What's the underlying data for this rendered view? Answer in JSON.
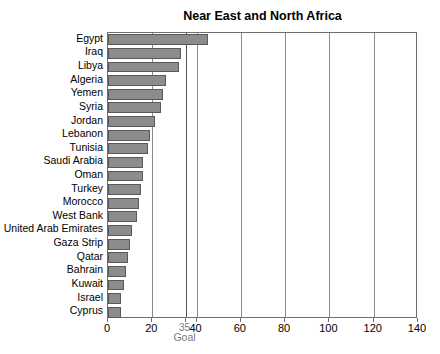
{
  "chart_data": {
    "type": "bar",
    "orientation": "horizontal",
    "title": "Near East and North Africa",
    "xlabel": "Goal",
    "ylabel": "",
    "xlim": [
      0,
      140
    ],
    "ylim": null,
    "grid": true,
    "legend": null,
    "xticks": [
      0,
      20,
      35,
      40,
      60,
      80,
      100,
      120,
      140
    ],
    "xtick_labels": [
      "0",
      "20",
      "35",
      "40",
      "60",
      "80",
      "100",
      "120",
      "140"
    ],
    "goal_value": 35,
    "goal_label": "Goal",
    "bar_color": "#8c8c8c",
    "bar_edge_color": "#595959",
    "categories": [
      "Egypt",
      "Iraq",
      "Libya",
      "Algeria",
      "Yemen",
      "Syria",
      "Jordan",
      "Lebanon",
      "Tunisia",
      "Saudi Arabia",
      "Oman",
      "Turkey",
      "Morocco",
      "West Bank",
      "United Arab Emirates",
      "Gaza Strip",
      "Qatar",
      "Bahrain",
      "Kuwait",
      "Israel",
      "Cyprus"
    ],
    "values": [
      45,
      33,
      32,
      26,
      25,
      24,
      21,
      19,
      18,
      16,
      16,
      15,
      14,
      13,
      11,
      10,
      9,
      8,
      7,
      6,
      6
    ]
  }
}
